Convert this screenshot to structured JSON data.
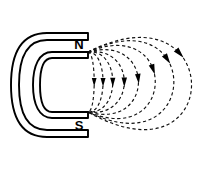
{
  "figure": {
    "background_color": "#ffffff",
    "width": 212,
    "height": 170
  },
  "magnet": {
    "name": "horseshoe-magnet",
    "outline_color": "#000000",
    "fill_color": "#ffffff",
    "stroke_width": 1.9,
    "outer_path": "M 88 33 L 47 33 C 22 33 11 52 11 85 C 11 118 22 137 47 137 L 88 137 L 88 130 L 47 130 C 27 130 19 113 19 85 C 19 57 27 40 47 40 L 88 40 Z",
    "inner_path": "M 88 52 L 52 52 C 39 52 33 66 33 85 C 33 104 39 118 52 118 L 88 118 L 88 112 L 52 112 C 43 112 40 101 40 85 C 40 69 43 58 52 58 L 88 58 Z",
    "north_pole": {
      "label": "N",
      "label_x": 79,
      "label_y": 44,
      "tip_x": 88,
      "tip_y": 52
    },
    "south_pole": {
      "label": "S",
      "label_x": 79,
      "label_y": 125,
      "tip_x": 88,
      "tip_y": 112
    }
  },
  "field": {
    "name": "magnetic-field-lines",
    "line_color": "#111111",
    "arrow_color": "#000000",
    "line_style": "dashed",
    "dash_pattern": "3.2 2.6",
    "stroke_width": 1.15,
    "direction": "north-to-south",
    "source_x": 88,
    "source_y": 52,
    "sink_x": 88,
    "sink_y": 112,
    "loop_count": 8,
    "loops": [
      {
        "id": "field-loop-1",
        "bulge": 7,
        "top_rise": 0,
        "bottom_drop": 0,
        "arrow_t": 0.5,
        "arrow_size": 4.6
      },
      {
        "id": "field-loop-2",
        "bulge": 17,
        "top_rise": 1,
        "bottom_drop": 1,
        "arrow_t": 0.5,
        "arrow_size": 4.8
      },
      {
        "id": "field-loop-3",
        "bulge": 28,
        "top_rise": 2,
        "bottom_drop": 2,
        "arrow_t": 0.5,
        "arrow_size": 5.0
      },
      {
        "id": "field-loop-4",
        "bulge": 41,
        "top_rise": 4,
        "bottom_drop": 4,
        "arrow_t": 0.5,
        "arrow_size": 5.2
      },
      {
        "id": "field-loop-5",
        "bulge": 57,
        "top_rise": 12,
        "bottom_drop": 12,
        "arrow_t": 0.47,
        "arrow_size": 5.4
      },
      {
        "id": "field-loop-6",
        "bulge": 76,
        "top_rise": 24,
        "bottom_drop": 24,
        "arrow_t": 0.41,
        "arrow_size": 5.6
      },
      {
        "id": "field-loop-7",
        "bulge": 97,
        "top_rise": 36,
        "bottom_drop": 36,
        "arrow_t": 0.36,
        "arrow_size": 5.8
      },
      {
        "id": "field-loop-8",
        "bulge": 117,
        "top_rise": 45,
        "bottom_drop": 50,
        "arrow_t": 0.33,
        "arrow_size": 6.0
      }
    ]
  }
}
